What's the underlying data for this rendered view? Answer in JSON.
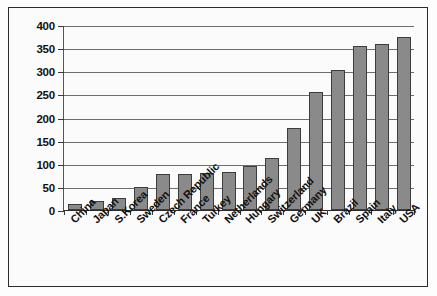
{
  "chart_data": {
    "type": "bar",
    "title": "",
    "subtitle": "",
    "xlabel": "",
    "ylabel": "",
    "ylim": [
      0,
      400
    ],
    "yticks": [
      0,
      50,
      100,
      150,
      200,
      250,
      300,
      350,
      400
    ],
    "grid": true,
    "legend": null,
    "bar_color": "#8a8a8a",
    "bar_border_color": "#3d3d3d",
    "axis_color": "#2b2b2b",
    "gridline_color": "#6e6e6e",
    "categories": [
      "China",
      "Japan",
      "S.Korea",
      "Sweden",
      "Czech Republic",
      "France",
      "Turkey",
      "Netherlands",
      "Hungary",
      "Switzerland",
      "Germany",
      "UK",
      "Brazil",
      "Spain",
      "Italy",
      "USA"
    ],
    "values": [
      12,
      20,
      25,
      50,
      78,
      78,
      79,
      83,
      95,
      112,
      177,
      255,
      303,
      355,
      358,
      375
    ]
  }
}
